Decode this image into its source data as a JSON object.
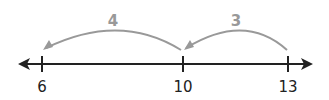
{
  "diagram": {
    "type": "number-line",
    "colors": {
      "line": "#222222",
      "jump": "#999999"
    },
    "ticks": [
      {
        "value": "6",
        "x": 42
      },
      {
        "value": "10",
        "x": 183
      },
      {
        "value": "13",
        "x": 288
      }
    ],
    "jumps": [
      {
        "label": "3",
        "from": "13",
        "to": "10"
      },
      {
        "label": "4",
        "from": "10",
        "to": "6"
      }
    ]
  }
}
